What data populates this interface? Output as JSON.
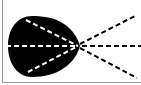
{
  "diagram": {
    "colors": {
      "background": "#ffffff",
      "blob": "#000000",
      "ray_inside": "#ffffff",
      "ray_outside": "#000000",
      "border": "#9a9a9a"
    },
    "focal_point": {
      "x": 78,
      "y": 46
    },
    "rays": [
      {
        "name": "upper",
        "from": {
          "x": 26,
          "y": 20
        },
        "to": {
          "x": 137,
          "y": 15
        }
      },
      {
        "name": "middle",
        "from": {
          "x": 6,
          "y": 46
        },
        "to": {
          "x": 141,
          "y": 46
        }
      },
      {
        "name": "lower",
        "from": {
          "x": 28,
          "y": 72
        },
        "to": {
          "x": 137,
          "y": 78
        }
      }
    ]
  }
}
